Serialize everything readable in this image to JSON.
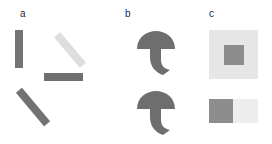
{
  "figure": {
    "width": 272,
    "height": 144,
    "background": "#ffffff"
  },
  "palette": {
    "label_text": "#2b2b2b",
    "dark_grey": "#6e6e6e",
    "mid_grey": "#808080",
    "light_grey": "#dcdcdc",
    "very_light_grey": "#e3e3e3",
    "pale_grey": "#eeeeee",
    "background": "#ffffff"
  },
  "panels": [
    {
      "id": "a",
      "label": "a",
      "shapes": [
        {
          "name": "vertical-bar",
          "color": "#747474",
          "angle_deg": 0,
          "length": 38,
          "thickness": 8
        },
        {
          "name": "diagonal-bar-light",
          "color": "#dedede",
          "angle_deg": -45,
          "length": 40,
          "thickness": 8
        },
        {
          "name": "horizontal-bar",
          "color": "#6f6f6f",
          "angle_deg": 90,
          "length": 39,
          "thickness": 8
        },
        {
          "name": "diagonal-bar-dark",
          "color": "#727272",
          "angle_deg": 45,
          "length": 44,
          "thickness": 8
        }
      ]
    },
    {
      "id": "b",
      "label": "b",
      "shapes": [
        {
          "name": "mushroom-shape-top",
          "color": "#6e6e6e",
          "cap_width": 38,
          "stem_style": "hooked"
        },
        {
          "name": "mushroom-shape-bottom",
          "color": "#6e6e6e",
          "cap_width": 38,
          "stem_style": "hooked"
        }
      ]
    },
    {
      "id": "c",
      "label": "c",
      "shapes": [
        {
          "name": "outer-square",
          "color": "#e6e6e6",
          "size": 49
        },
        {
          "name": "inner-square",
          "color": "#8d8d8d",
          "size": 20
        },
        {
          "name": "split-left-square",
          "color": "#8d8d8d",
          "size": 24
        },
        {
          "name": "split-right-square",
          "color": "#ededed",
          "size": 24
        }
      ]
    }
  ]
}
